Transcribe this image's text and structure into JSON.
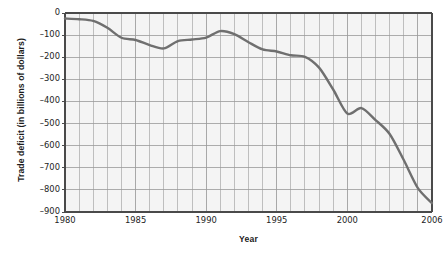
{
  "chart_data": {
    "type": "line",
    "title": "",
    "xlabel": "Year",
    "ylabel": "Trade deficit (in billions of dollars)",
    "xlim": [
      1980,
      2006
    ],
    "ylim": [
      -900,
      0
    ],
    "xticks": [
      1980,
      1985,
      1990,
      1995,
      2000,
      2006
    ],
    "xtick_labels": [
      "1980",
      "1985",
      "1990",
      "1995",
      "2000",
      "2006"
    ],
    "yticks": [
      0,
      -100,
      -200,
      -300,
      -400,
      -500,
      -600,
      -700,
      -800,
      -900
    ],
    "ytick_labels": [
      "0",
      "–100",
      "–200",
      "–300",
      "–400",
      "–500",
      "–600",
      "–700",
      "–800",
      "–900"
    ],
    "grid": true,
    "grid_x_step": 1,
    "grid_y_step": 100,
    "legend": "none",
    "x": [
      1980,
      1981,
      1982,
      1983,
      1984,
      1985,
      1986,
      1987,
      1988,
      1989,
      1990,
      1991,
      1992,
      1993,
      1994,
      1995,
      1996,
      1997,
      1998,
      1999,
      2000,
      2001,
      2002,
      2003,
      2004,
      2005,
      2006
    ],
    "values": [
      -25,
      -28,
      -36,
      -67,
      -112,
      -122,
      -145,
      -160,
      -127,
      -120,
      -111,
      -82,
      -96,
      -132,
      -165,
      -174,
      -191,
      -198,
      -247,
      -346,
      -455,
      -430,
      -484,
      -547,
      -665,
      -792,
      -860
    ],
    "series": [
      {
        "name": "Trade deficit",
        "color": "#6f6f6f",
        "values": [
          -25,
          -28,
          -36,
          -67,
          -112,
          -122,
          -145,
          -160,
          -127,
          -120,
          -111,
          -82,
          -96,
          -132,
          -165,
          -174,
          -191,
          -198,
          -247,
          -346,
          -455,
          -430,
          -484,
          -547,
          -665,
          -792,
          -860
        ]
      }
    ]
  },
  "style": {
    "plot_background": "#f4f4f4",
    "grid_color": "#9a9a9a",
    "axis_color": "#4a4a4a",
    "line_color": "#6f6f6f",
    "text_color": "#242424"
  }
}
